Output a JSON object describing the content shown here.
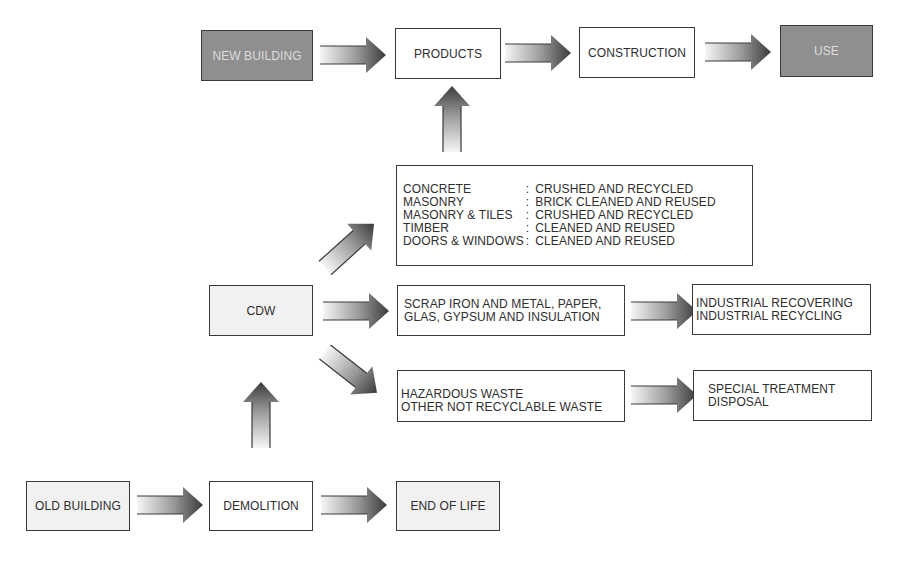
{
  "diagram": {
    "type": "flowchart",
    "title": "",
    "colors": {
      "dark_box": "#8f8f8f",
      "light_box": "#f1f1f1",
      "border": "#3a3a3a",
      "arrow_dark": "#3c3c3c",
      "arrow_light": "#f4f4f4"
    },
    "nodes": {
      "new_building": "NEW BUILDING",
      "products": "PRODUCTS",
      "construction": "CONSTRUCTION",
      "use": "USE",
      "cdw": "CDW",
      "old_building": "OLD BUILDING",
      "demolition": "DEMOLITION",
      "end_of_life": "END OF LIFE",
      "scrap": [
        "SCRAP IRON AND METAL, PAPER,",
        "GLAS, GYPSUM AND INSULATION"
      ],
      "industrial": [
        "INDUSTRIAL RECOVERING",
        "INDUSTRIAL RECYCLING"
      ],
      "hazardous": [
        "HAZARDOUS WASTE",
        "OTHER NOT RECYCLABLE WASTE"
      ],
      "special": [
        "SPECIAL TREATMENT",
        "DISPOSAL"
      ],
      "materials": [
        {
          "material": "CONCRETE",
          "separator": ":",
          "treatment": "CRUSHED AND RECYCLED"
        },
        {
          "material": "MASONRY",
          "separator": ":",
          "treatment": "BRICK CLEANED AND REUSED"
        },
        {
          "material": "MASONRY & TILES",
          "separator": ":",
          "treatment": "CRUSHED AND RECYCLED"
        },
        {
          "material": "TIMBER",
          "separator": ":",
          "treatment": "CLEANED AND REUSED"
        },
        {
          "material": "DOORS &  WINDOWS",
          "separator": ":",
          "treatment": "CLEANED AND REUSED"
        }
      ]
    },
    "edges": [
      [
        "NEW BUILDING",
        "PRODUCTS"
      ],
      [
        "PRODUCTS",
        "CONSTRUCTION"
      ],
      [
        "CONSTRUCTION",
        "USE"
      ],
      [
        "OLD BUILDING",
        "DEMOLITION"
      ],
      [
        "DEMOLITION",
        "END OF LIFE"
      ],
      [
        "DEMOLITION",
        "CDW"
      ],
      [
        "CDW",
        "MATERIALS"
      ],
      [
        "CDW",
        "SCRAP"
      ],
      [
        "CDW",
        "HAZARDOUS"
      ],
      [
        "MATERIALS",
        "PRODUCTS"
      ],
      [
        "SCRAP",
        "INDUSTRIAL"
      ],
      [
        "HAZARDOUS",
        "SPECIAL"
      ]
    ]
  }
}
